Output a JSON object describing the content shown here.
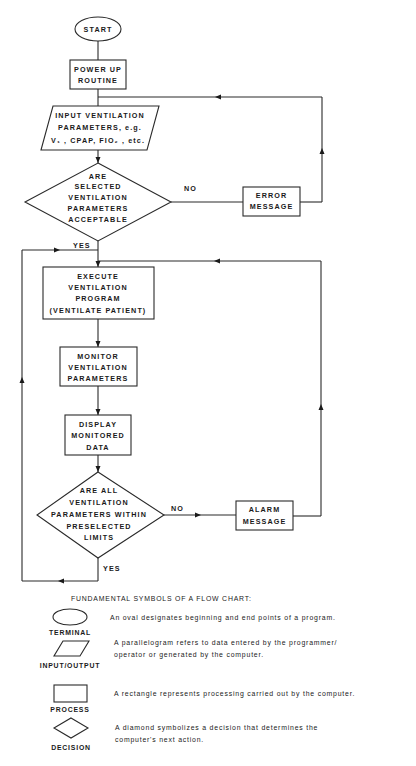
{
  "flowchart": {
    "start": "START",
    "power_up": [
      "POWER UP",
      "ROUTINE"
    ],
    "input": [
      "INPUT VENTILATION",
      "PARAMETERS, e.g.",
      "V₁ , CPAP, FIO₂ , etc."
    ],
    "decision1": [
      "ARE",
      "SELECTED",
      "VENTILATION",
      "PARAMETERS",
      "ACCEPTABLE"
    ],
    "decision1_no": "NO",
    "decision1_yes": "YES",
    "error": [
      "ERROR",
      "MESSAGE"
    ],
    "execute": [
      "EXECUTE",
      "VENTILATION",
      "PROGRAM",
      "(VENTILATE PATIENT)"
    ],
    "monitor": [
      "MONITOR",
      "VENTILATION",
      "PARAMETERS"
    ],
    "display": [
      "DISPLAY",
      "MONITORED",
      "DATA"
    ],
    "decision2": [
      "ARE ALL",
      "VENTILATION",
      "PARAMETERS WITHIN",
      "PRESELECTED",
      "LIMITS"
    ],
    "decision2_no": "NO",
    "decision2_yes": "YES",
    "alarm": [
      "ALARM",
      "MESSAGE"
    ]
  },
  "legend": {
    "title": "FUNDAMENTAL SYMBOLS OF A FLOW CHART:",
    "items": [
      {
        "symbol": "oval",
        "label": "TERMINAL",
        "desc": [
          "An oval designates beginning and end points of a program."
        ]
      },
      {
        "symbol": "parallelogram",
        "label": "INPUT/OUTPUT",
        "desc": [
          "A parallelogram refers to data entered by the programmer/",
          "operator or generated by the computer."
        ]
      },
      {
        "symbol": "rectangle",
        "label": "PROCESS",
        "desc": [
          "A rectangle represents processing carried out by the computer."
        ]
      },
      {
        "symbol": "diamond",
        "label": "DECISION",
        "desc": [
          "A diamond symbolizes a decision that determines  the",
          "computer's next action."
        ]
      }
    ]
  }
}
